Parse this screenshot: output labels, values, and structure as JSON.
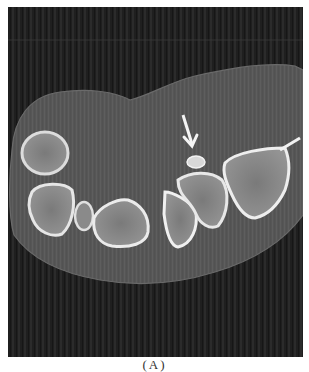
{
  "figure": {
    "type": "axial CT slice of wrist (carpal bones)",
    "colors": {
      "background": "#1e1e1e",
      "soft_tissue": "#5a5a5a",
      "bone_cortex": "#e6e6e6",
      "bone_marrow": "#8c8c8c",
      "arrow": "#f4f4f4"
    },
    "annotations": [
      {
        "kind": "arrow",
        "direction": "down",
        "target": "small bright bony fragment"
      }
    ]
  },
  "caption": {
    "label": "(A)"
  }
}
